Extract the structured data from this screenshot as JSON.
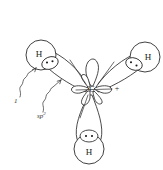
{
  "figure": {
    "background_color": "#ffffff",
    "ink_color": "#2b2b2b",
    "width": 163,
    "height": 170
  },
  "central_atom": {
    "symbol": "C",
    "hybridization": "sp2",
    "charge_symbol": "+",
    "x": 92,
    "y": 89
  },
  "hydrogens": [
    {
      "symbol": "H",
      "position": "upper-left",
      "x": 41,
      "y": 55,
      "radius": 15
    },
    {
      "symbol": "H",
      "position": "upper-right",
      "x": 145,
      "y": 57,
      "radius": 15
    },
    {
      "symbol": "H",
      "position": "bottom",
      "x": 89,
      "y": 149,
      "radius": 15
    }
  ],
  "electron_pairs": [
    {
      "label": "bonding-pair-upper-left",
      "dots": 2,
      "x": 50,
      "y": 63
    },
    {
      "label": "bonding-pair-upper-right",
      "dots": 2,
      "x": 134,
      "y": 64
    },
    {
      "label": "bonding-pair-bottom",
      "dots": 2,
      "x": 89,
      "y": 136
    }
  ],
  "annotations": [
    {
      "id": "label-1s",
      "text": "1s",
      "base": "1",
      "sup": "",
      "italic": true,
      "x": 14,
      "y": 101
    },
    {
      "id": "label-sp2",
      "text": "sp2",
      "base": "sp",
      "sup": "2",
      "italic": true,
      "x": 37,
      "y": 116
    }
  ],
  "orbitals": {
    "empty_p_label": "empty p orbital",
    "sp2_lobe_count": 3,
    "small_lobe_count": 5
  }
}
